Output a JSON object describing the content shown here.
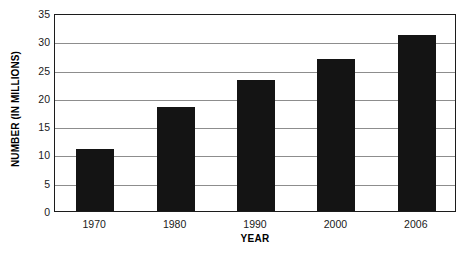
{
  "chart_data": {
    "type": "bar",
    "title": "",
    "subtitle": "",
    "categories": [
      "1970",
      "1980",
      "1990",
      "2000",
      "2006"
    ],
    "values": [
      10.9,
      18.4,
      23.1,
      26.8,
      31.2
    ],
    "xlabel": "YEAR",
    "ylabel": "NUMBER (IN MILLIONS)",
    "ylim": [
      0,
      35
    ],
    "ytick_step": 5,
    "yticks": [
      "35",
      "30",
      "25",
      "20",
      "15",
      "10",
      "5",
      "0"
    ],
    "ytick_values": [
      35,
      30,
      25,
      20,
      15,
      10,
      5,
      0
    ],
    "grid": "horizontal",
    "legend": "none",
    "bar_color": "#141414",
    "gridline_color": "#8d8d8d",
    "axis_color": "#1c1c1c",
    "background_color": "#ffffff"
  }
}
